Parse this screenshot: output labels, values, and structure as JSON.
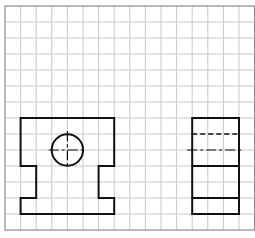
{
  "diagram": {
    "type": "orthographic-projection-on-grid",
    "grid": {
      "columns": 16,
      "rows": 14,
      "origin_px": [
        5,
        6
      ],
      "cell_w_px": 15.6,
      "cell_h_px": 16,
      "line_color": "#c8c8c8",
      "border_color": "#8a8a8a"
    },
    "views": [
      {
        "name": "front-view",
        "outline_grid": [
          [
            1,
            7
          ],
          [
            7,
            7
          ],
          [
            7,
            10
          ],
          [
            6,
            10
          ],
          [
            6,
            12
          ],
          [
            7,
            12
          ],
          [
            7,
            13
          ],
          [
            1,
            13
          ],
          [
            1,
            12
          ],
          [
            2,
            12
          ],
          [
            2,
            10
          ],
          [
            1,
            10
          ]
        ],
        "hole": {
          "center_grid": [
            4,
            9
          ],
          "radius_cells": 1,
          "centerlines": true
        }
      },
      {
        "name": "side-view",
        "box_grid": {
          "x1": 12,
          "y1": 7,
          "x2": 15,
          "y2": 13
        },
        "hidden_lines_grid_y": [
          8
        ],
        "center_line_grid_y": [
          9
        ],
        "solid_lines_grid_y": [
          10,
          12
        ]
      }
    ],
    "line_color": "#111111"
  }
}
